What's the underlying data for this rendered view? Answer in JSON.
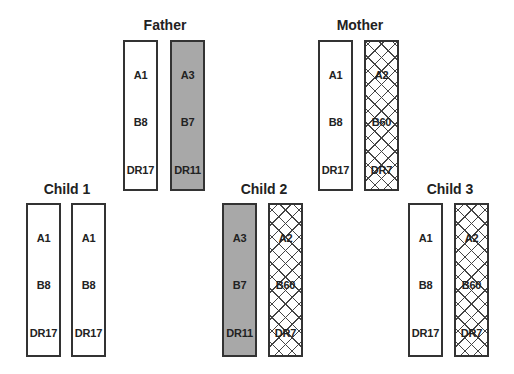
{
  "colors": {
    "border": "#333333",
    "shaded_fill": "#a8a8a8",
    "hatch": "#444444",
    "background": "#ffffff"
  },
  "legend_patterns": {
    "plain": "white haplotype",
    "shaded": "grey haplotype (from father)",
    "hatched": "cross-hatched haplotype (from mother)"
  },
  "people": {
    "father": {
      "label": "Father",
      "haplotypes": [
        {
          "pattern": "plain",
          "A": "A1",
          "B": "B8",
          "DR": "DR17"
        },
        {
          "pattern": "shaded",
          "A": "A3",
          "B": "B7",
          "DR": "DR11"
        }
      ]
    },
    "mother": {
      "label": "Mother",
      "haplotypes": [
        {
          "pattern": "plain",
          "A": "A1",
          "B": "B8",
          "DR": "DR17"
        },
        {
          "pattern": "hatched",
          "A": "A2",
          "B": "B60",
          "DR": "DR7"
        }
      ]
    },
    "child1": {
      "label": "Child 1",
      "haplotypes": [
        {
          "pattern": "plain",
          "A": "A1",
          "B": "B8",
          "DR": "DR17"
        },
        {
          "pattern": "plain",
          "A": "A1",
          "B": "B8",
          "DR": "DR17"
        }
      ]
    },
    "child2": {
      "label": "Child 2",
      "haplotypes": [
        {
          "pattern": "shaded",
          "A": "A3",
          "B": "B7",
          "DR": "DR11"
        },
        {
          "pattern": "hatched",
          "A": "A2",
          "B": "B60",
          "DR": "DR7"
        }
      ]
    },
    "child3": {
      "label": "Child 3",
      "haplotypes": [
        {
          "pattern": "plain",
          "A": "A1",
          "B": "B8",
          "DR": "DR17"
        },
        {
          "pattern": "hatched",
          "A": "A2",
          "B": "B60",
          "DR": "DR7"
        }
      ]
    }
  }
}
